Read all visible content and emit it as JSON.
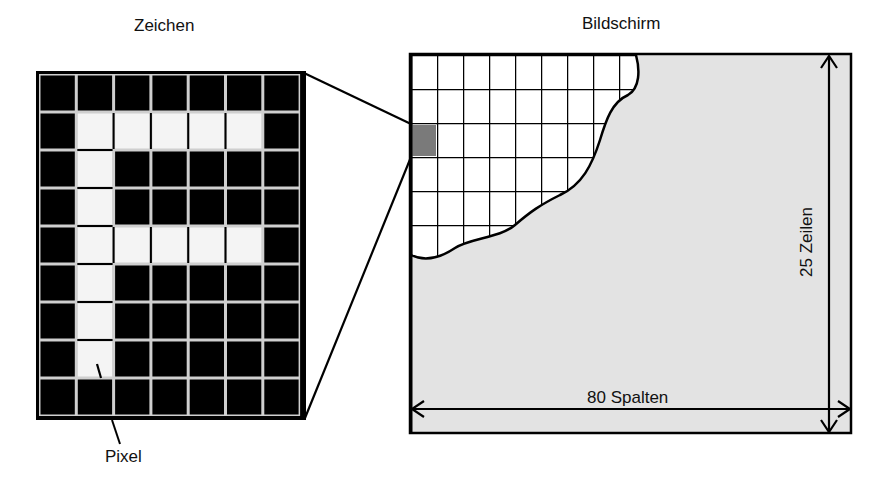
{
  "titles": {
    "character": "Zeichen",
    "screen": "Bildschirm"
  },
  "labels": {
    "pixel": "Pixel",
    "columns": "80 Spalten",
    "rows": "25 Zeilen"
  },
  "character_grid": {
    "columns": 7,
    "rows": 9,
    "letter": "F",
    "lit_color": "#f4f4f4",
    "unlit_color": "#000000",
    "cells": [
      "0000000",
      "0111110",
      "0100000",
      "0100000",
      "0111110",
      "0100000",
      "0100000",
      "0100000",
      "0000000"
    ]
  },
  "screen": {
    "columns": 80,
    "rows": 25,
    "background_color": "#e3e3e3",
    "highlight_color": "#7a7a7a"
  }
}
